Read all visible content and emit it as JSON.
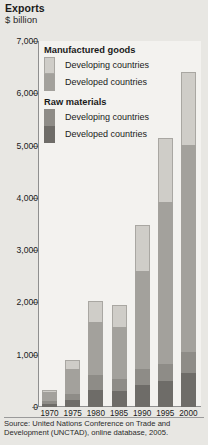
{
  "header": {
    "title": "Exports",
    "unit": "$ billion"
  },
  "source": "Source: United Nations Conference on Trade and Development (UNCTAD), online database, 2005.",
  "legend": {
    "groups": [
      {
        "title": "Manufactured goods",
        "entries": [
          {
            "label": "Developing countries",
            "swatch": "light-gray",
            "color": "#cfcdc8"
          },
          {
            "label": "Developed countries",
            "swatch": "medium-gray",
            "color": "#a3a19c"
          }
        ]
      },
      {
        "title": "Raw materials",
        "entries": [
          {
            "label": "Developing countries",
            "swatch": "dark-gray",
            "color": "#8e8c87"
          },
          {
            "label": "Developed countries",
            "swatch": "darkest-gray",
            "color": "#6e6c68"
          }
        ]
      }
    ]
  },
  "axis": {
    "y_ticks": [
      "7,000",
      "6,000",
      "5,000",
      "4,000",
      "3,000",
      "2,000",
      "1,000",
      "0"
    ],
    "x_ticks": [
      "1970",
      "1975",
      "1980",
      "1985",
      "1990",
      "1995",
      "2000"
    ]
  },
  "chart_data": {
    "type": "bar",
    "title": "Exports",
    "subtitle": "$ billion",
    "xlabel": "",
    "ylabel": "$ billion",
    "ylim": [
      0,
      7000
    ],
    "ytick_step": 1000,
    "grid": false,
    "stacked": true,
    "legend_position": "inside-top-left",
    "categories": [
      "1970",
      "1975",
      "1980",
      "1985",
      "1990",
      "1995",
      "2000"
    ],
    "series": [
      {
        "name": "Raw materials - Developed countries",
        "color": "#6e6c68",
        "values": [
          60,
          130,
          330,
          300,
          430,
          500,
          660
        ]
      },
      {
        "name": "Raw materials - Developing countries",
        "color": "#8e8c87",
        "values": [
          50,
          110,
          290,
          240,
          300,
          330,
          400
        ]
      },
      {
        "name": "Manufactured goods - Developed countries",
        "color": "#a3a19c",
        "values": [
          170,
          480,
          1000,
          990,
          1880,
          3100,
          3950
        ]
      },
      {
        "name": "Manufactured goods - Developing countries",
        "color": "#cfcdc8",
        "values": [
          50,
          170,
          410,
          420,
          870,
          1220,
          1390
        ]
      }
    ],
    "totals": [
      330,
      890,
      2030,
      1950,
      3480,
      5150,
      6400
    ],
    "annotations": [
      "Source: United Nations Conference on Trade and Development (UNCTAD), online database, 2005."
    ]
  }
}
